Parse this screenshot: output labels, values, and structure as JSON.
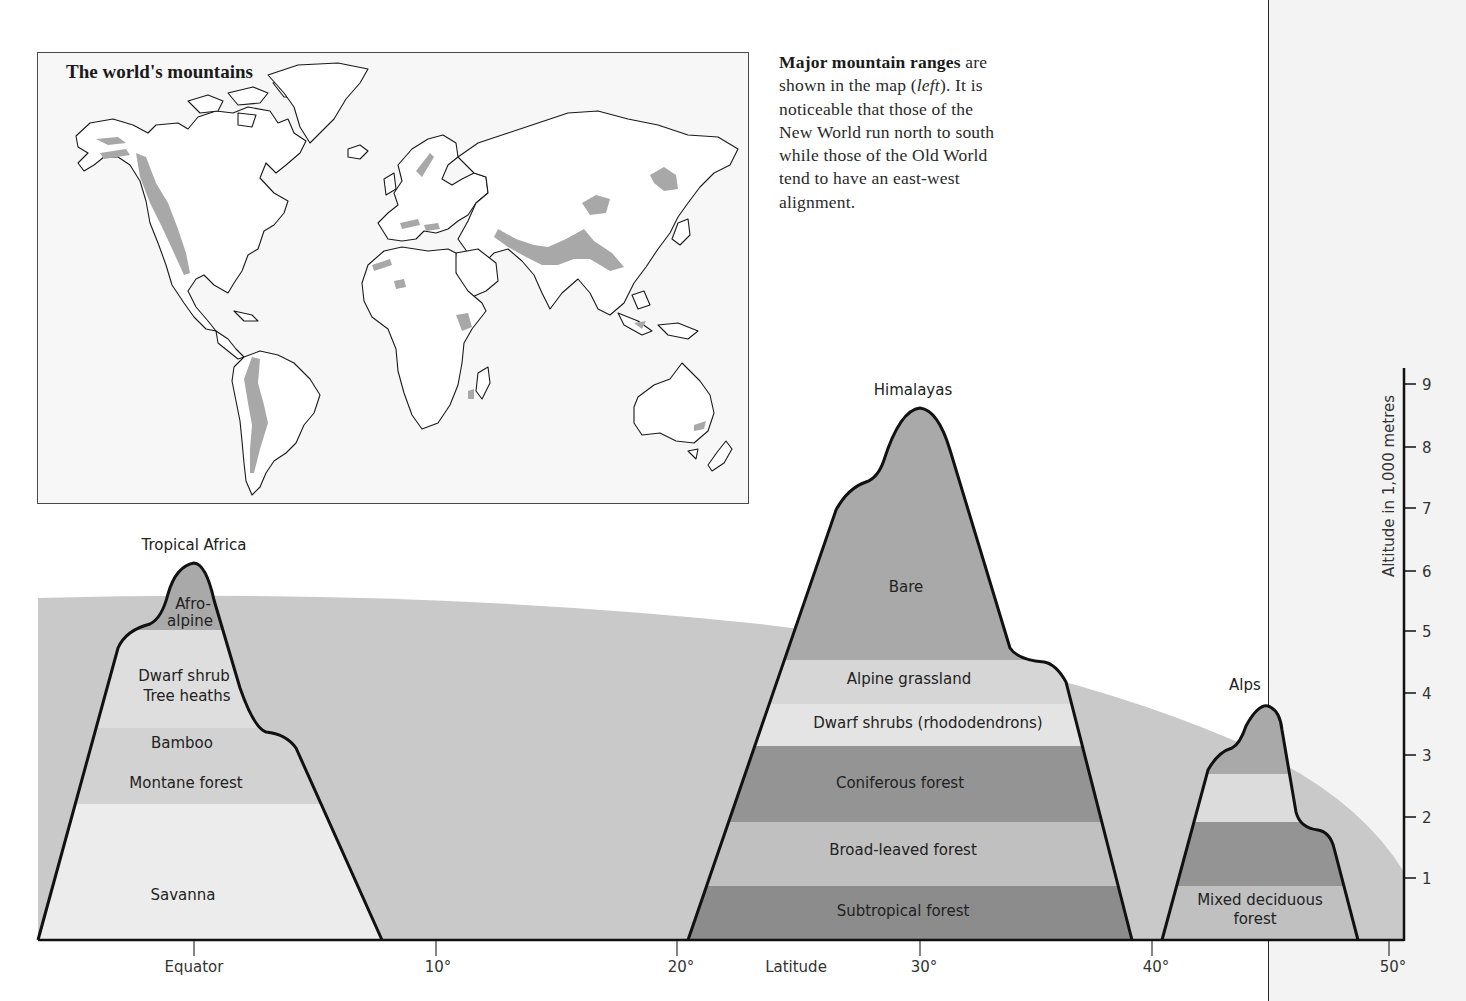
{
  "map": {
    "title": "The world's mountains",
    "colors": {
      "land": "#ffffff",
      "mountains": "#a8a8a8",
      "outline": "#1a1a1a",
      "background": "#f7f7f7"
    }
  },
  "caption": {
    "bold": "Major mountain ranges",
    "text_1": " are shown in the map (",
    "italic": "left",
    "text_2": "). It is noticeable that those of the New World run north to south while those of the Old World tend to have an east-west alignment."
  },
  "diagram": {
    "x_axis": {
      "title": "Latitude",
      "ticks": [
        {
          "label": "Equator",
          "deg": 0
        },
        {
          "label": "10°",
          "deg": 10
        },
        {
          "label": "20°",
          "deg": 20
        },
        {
          "label": "30°",
          "deg": 30
        },
        {
          "label": "40°",
          "deg": 40
        },
        {
          "label": "50°",
          "deg": 50
        }
      ]
    },
    "y_axis": {
      "title": "Altitude in 1,000 metres",
      "ticks": [
        "1",
        "2",
        "3",
        "4",
        "5",
        "6",
        "7",
        "8",
        "9"
      ]
    },
    "snowline_band_color": "#c9c9c9",
    "mountains": [
      {
        "name": "Tropical Africa",
        "latitude_deg": 0,
        "peak_altitude_km": 6.2,
        "zones": [
          {
            "label": "Afro-alpine",
            "label_line1": "Afro-",
            "label_line2": "alpine",
            "from_km": 5.3,
            "to_km": 6.2,
            "color": "#a9a9a9"
          },
          {
            "label": "Dwarf shrub / Tree heaths",
            "label_line1": "Dwarf shrub",
            "label_line2": "Tree heaths",
            "from_km": 3.5,
            "to_km": 5.3,
            "color": "#dedede"
          },
          {
            "label": "Bamboo",
            "from_km": 2.8,
            "to_km": 3.5,
            "color": "#d2d2d2"
          },
          {
            "label": "Montane forest",
            "from_km": 2.2,
            "to_km": 2.8,
            "color": "#d2d2d2"
          },
          {
            "label": "Savanna",
            "from_km": 0,
            "to_km": 2.2,
            "color": "#ececec"
          }
        ]
      },
      {
        "name": "Himalayas",
        "latitude_deg": 30,
        "peak_altitude_km": 8.6,
        "zones": [
          {
            "label": "Bare",
            "from_km": 4.6,
            "to_km": 8.6,
            "color": "#a9a9a9"
          },
          {
            "label": "Alpine grassland",
            "from_km": 3.9,
            "to_km": 4.6,
            "color": "#d6d6d6"
          },
          {
            "label": "Dwarf shrubs (rhododendrons)",
            "from_km": 3.2,
            "to_km": 3.9,
            "color": "#e4e4e4"
          },
          {
            "label": "Coniferous forest",
            "from_km": 2.0,
            "to_km": 3.2,
            "color": "#949494"
          },
          {
            "label": "Broad-leaved forest",
            "from_km": 0.9,
            "to_km": 2.0,
            "color": "#c0c0c0"
          },
          {
            "label": "Subtropical forest",
            "from_km": 0,
            "to_km": 0.9,
            "color": "#8c8c8c"
          }
        ]
      },
      {
        "name": "Alps",
        "latitude_deg": 45,
        "peak_altitude_km": 3.8,
        "zones": [
          {
            "label": "",
            "from_km": 2.7,
            "to_km": 3.8,
            "color": "#a9a9a9"
          },
          {
            "label": "",
            "from_km": 2.0,
            "to_km": 2.7,
            "color": "#dcdcdc"
          },
          {
            "label": "",
            "from_km": 0.9,
            "to_km": 2.0,
            "color": "#949494"
          },
          {
            "label": "Mixed deciduous forest",
            "label_line1": "Mixed deciduous",
            "label_line2": "forest",
            "from_km": 0,
            "to_km": 0.9,
            "color": "#c0c0c0"
          }
        ]
      }
    ]
  }
}
